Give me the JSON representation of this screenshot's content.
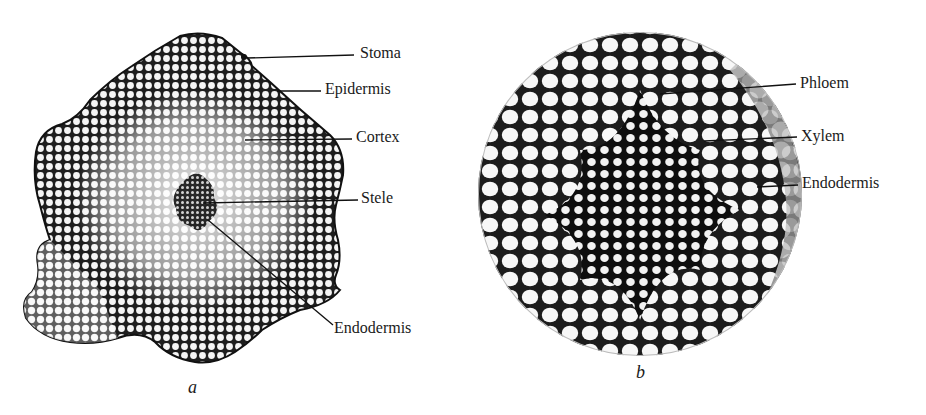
{
  "figure": {
    "panels": [
      {
        "id": "a",
        "caption": "a",
        "labels": [
          "Stoma",
          "Epidermis",
          "Cortex",
          "Stele",
          "Endodermis"
        ]
      },
      {
        "id": "b",
        "caption": "b",
        "labels": [
          "Phloem",
          "Xylem",
          "Endodermis"
        ]
      }
    ]
  },
  "colors": {
    "ink": "#1a1a1a",
    "cell_wall": "#222222",
    "cell_fill": "#f4f4f4",
    "background": "#ffffff"
  }
}
